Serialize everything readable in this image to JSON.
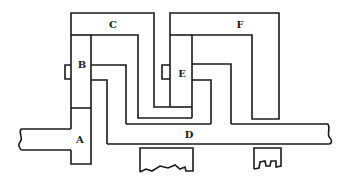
{
  "diagram": {
    "type": "mechanical-schematic",
    "labels": {
      "A": "A",
      "B": "B",
      "C": "C",
      "D": "D",
      "E": "E",
      "F": "F"
    },
    "colors": {
      "stroke": "#1a1a1a",
      "background": "#ffffff"
    }
  }
}
